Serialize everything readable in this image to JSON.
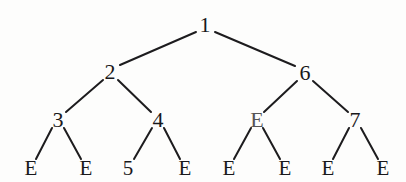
{
  "diagram": {
    "kind": "binary-tree",
    "title": "",
    "background_color": "#fdfdfc",
    "edge_color": "#1d1c1e",
    "text_color": "#19181a",
    "nodes": [
      {
        "id": "n1",
        "label": "1",
        "x": 205,
        "y": 25,
        "level": 0,
        "tone": "dark",
        "kind": "internal"
      },
      {
        "id": "n2",
        "label": "2",
        "x": 110,
        "y": 72,
        "level": 1,
        "tone": "dark",
        "kind": "internal"
      },
      {
        "id": "n6",
        "label": "6",
        "x": 305,
        "y": 73,
        "level": 1,
        "tone": "dark",
        "kind": "internal"
      },
      {
        "id": "n3",
        "label": "3",
        "x": 58,
        "y": 120,
        "level": 2,
        "tone": "dark",
        "kind": "internal"
      },
      {
        "id": "n4",
        "label": "4",
        "x": 158,
        "y": 120,
        "level": 2,
        "tone": "dark",
        "kind": "internal"
      },
      {
        "id": "nE1",
        "label": "E",
        "x": 257,
        "y": 120,
        "level": 2,
        "tone": "light",
        "kind": "internal"
      },
      {
        "id": "n7",
        "label": "7",
        "x": 355,
        "y": 120,
        "level": 2,
        "tone": "dark",
        "kind": "internal"
      },
      {
        "id": "l1",
        "label": "E",
        "x": 31,
        "y": 168,
        "level": 3,
        "tone": "dark",
        "kind": "leaf"
      },
      {
        "id": "l2",
        "label": "E",
        "x": 86,
        "y": 168,
        "level": 3,
        "tone": "dark",
        "kind": "leaf"
      },
      {
        "id": "l3",
        "label": "5",
        "x": 128,
        "y": 168,
        "level": 3,
        "tone": "dark",
        "kind": "leaf"
      },
      {
        "id": "l4",
        "label": "E",
        "x": 185,
        "y": 168,
        "level": 3,
        "tone": "dark",
        "kind": "leaf"
      },
      {
        "id": "l5",
        "label": "E",
        "x": 229,
        "y": 168,
        "level": 3,
        "tone": "dark",
        "kind": "leaf"
      },
      {
        "id": "l6",
        "label": "E",
        "x": 285,
        "y": 168,
        "level": 3,
        "tone": "dark",
        "kind": "leaf"
      },
      {
        "id": "l7",
        "label": "E",
        "x": 328,
        "y": 168,
        "level": 3,
        "tone": "dark",
        "kind": "leaf"
      },
      {
        "id": "l8",
        "label": "E",
        "x": 383,
        "y": 168,
        "level": 3,
        "tone": "dark",
        "kind": "leaf"
      }
    ],
    "edges": [
      {
        "from": "n1",
        "to": "n2",
        "x1": 196,
        "y1": 32,
        "x2": 120,
        "y2": 65
      },
      {
        "from": "n1",
        "to": "n6",
        "x1": 215,
        "y1": 32,
        "x2": 295,
        "y2": 66
      },
      {
        "from": "n2",
        "to": "n3",
        "x1": 103,
        "y1": 80,
        "x2": 66,
        "y2": 112
      },
      {
        "from": "n2",
        "to": "n4",
        "x1": 118,
        "y1": 80,
        "x2": 151,
        "y2": 112
      },
      {
        "from": "n6",
        "to": "nE1",
        "x1": 297,
        "y1": 81,
        "x2": 264,
        "y2": 112
      },
      {
        "from": "n6",
        "to": "n7",
        "x1": 313,
        "y1": 81,
        "x2": 348,
        "y2": 112
      },
      {
        "from": "n3",
        "to": "l1",
        "x1": 52,
        "y1": 128,
        "x2": 36,
        "y2": 159
      },
      {
        "from": "n3",
        "to": "l2",
        "x1": 64,
        "y1": 128,
        "x2": 81,
        "y2": 159
      },
      {
        "from": "n4",
        "to": "l3",
        "x1": 152,
        "y1": 128,
        "x2": 134,
        "y2": 159
      },
      {
        "from": "n4",
        "to": "l4",
        "x1": 164,
        "y1": 128,
        "x2": 180,
        "y2": 159
      },
      {
        "from": "nE1",
        "to": "l5",
        "x1": 251,
        "y1": 128,
        "x2": 234,
        "y2": 159
      },
      {
        "from": "nE1",
        "to": "l6",
        "x1": 263,
        "y1": 128,
        "x2": 280,
        "y2": 159
      },
      {
        "from": "n7",
        "to": "l7",
        "x1": 349,
        "y1": 128,
        "x2": 333,
        "y2": 159
      },
      {
        "from": "n7",
        "to": "l8",
        "x1": 361,
        "y1": 128,
        "x2": 378,
        "y2": 159
      }
    ]
  }
}
